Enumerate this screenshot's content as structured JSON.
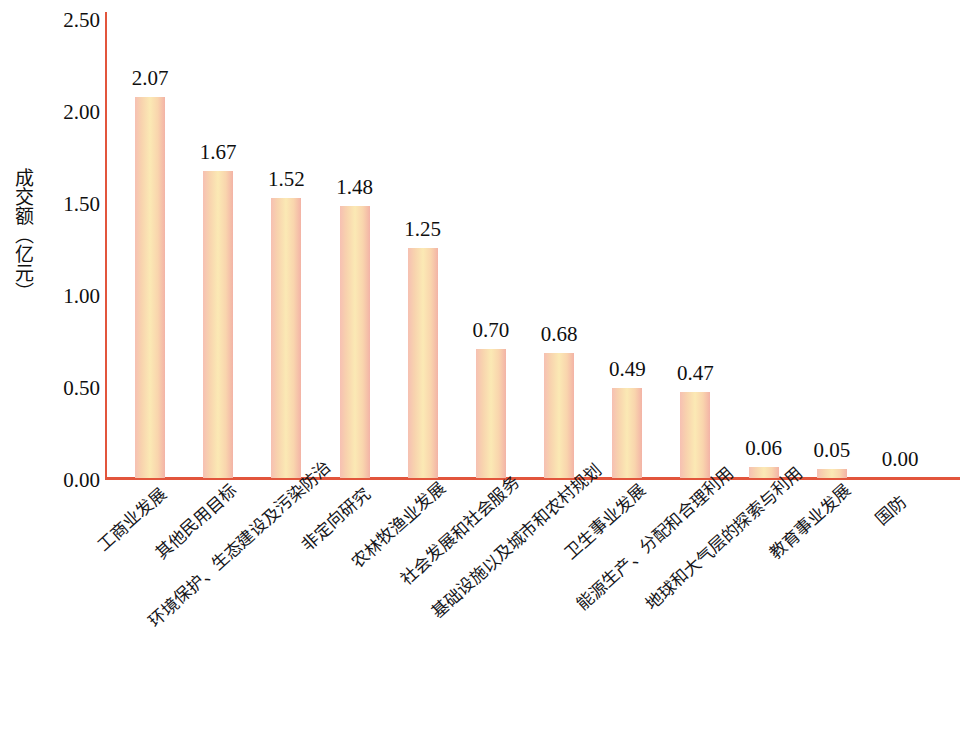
{
  "chart_data": {
    "type": "bar",
    "title": "",
    "subtitle": "",
    "xlabel": "",
    "ylabel": "成交额（亿元）",
    "ylim": [
      0,
      2.5
    ],
    "yticks": [
      "0.00",
      "0.50",
      "1.00",
      "1.50",
      "2.00",
      "2.50"
    ],
    "ytick_values": [
      0.0,
      0.5,
      1.0,
      1.5,
      2.0,
      2.5
    ],
    "grid": false,
    "legend": false,
    "categories": [
      "工商业发展",
      "其他民用目标",
      "环境保护、生态建设及污染防治",
      "非定向研究",
      "农林牧渔业发展",
      "社会发展和社会服务",
      "基础设施以及城市和农村规划",
      "卫生事业发展",
      "能源生产、分配和合理利用",
      "地球和大气层的探索与利用",
      "教育事业发展",
      "国防"
    ],
    "values": [
      2.07,
      1.67,
      1.52,
      1.48,
      1.25,
      0.7,
      0.68,
      0.49,
      0.47,
      0.06,
      0.05,
      0.0
    ],
    "value_labels": [
      "2.07",
      "1.67",
      "1.52",
      "1.48",
      "1.25",
      "0.70",
      "0.68",
      "0.49",
      "0.47",
      "0.06",
      "0.05",
      "0.00"
    ],
    "colors": {
      "axis": "#e2553c",
      "bar_edge": "#f3b3a6",
      "bar_mid": "#fbe9b4",
      "background": "#ffffff",
      "text": "#0f0f0f"
    }
  }
}
